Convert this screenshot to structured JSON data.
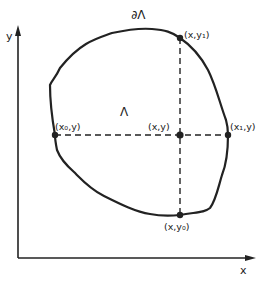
{
  "diagram": {
    "axes": {
      "x_label": "x",
      "y_label": "y"
    },
    "region": {
      "interior_label": "Λ",
      "boundary_label": "∂Λ"
    },
    "points": {
      "left": "(x₀,y)",
      "center": "(x,y)",
      "right": "(x₁,y)",
      "top": "(x,y₁)",
      "bottom": "(x,y₀)"
    },
    "colors": {
      "ink": "#222222",
      "background": "#ffffff"
    }
  }
}
